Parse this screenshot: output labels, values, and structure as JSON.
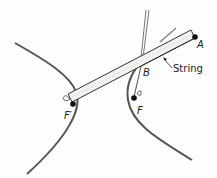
{
  "diagram": {
    "labels": {
      "A": "A",
      "B": "B",
      "F": "F",
      "F_prime": "F′",
      "string": "String"
    },
    "colors": {
      "curve": "#555555",
      "ink": "#222222",
      "ruler_fill": "#f2f2ee"
    }
  }
}
